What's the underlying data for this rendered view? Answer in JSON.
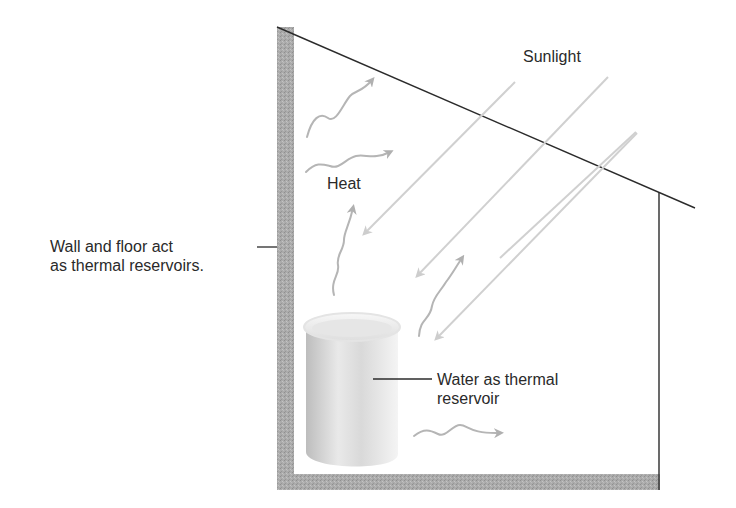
{
  "diagram": {
    "type": "passive solar heating illustration",
    "labels": {
      "sunlight": "Sunlight",
      "heat": "Heat",
      "wall_floor": [
        "Wall and floor act",
        "as thermal reservoirs."
      ],
      "water": [
        "Water as thermal",
        "reservoir"
      ]
    },
    "colors": {
      "wall": "#a9a9a9",
      "outline": "#2b2b2b",
      "sun_ray": "#cfcfcf",
      "heat_wave": "#b4b4b4",
      "barrel": "#d8d8d8"
    },
    "elements": [
      "sloped roof line",
      "left wall (thermal reservoir)",
      "floor (thermal reservoir)",
      "right wall line",
      "4 sunlight rays entering",
      "5 wavy heat arrows",
      "water barrel"
    ]
  }
}
